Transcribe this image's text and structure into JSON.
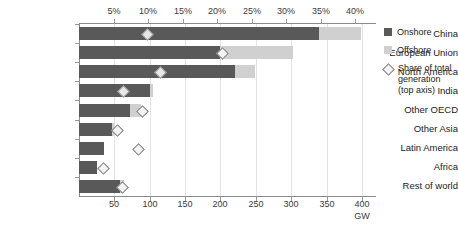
{
  "chart_data": {
    "type": "bar",
    "orientation": "horizontal",
    "title": "",
    "subtitle": "",
    "xlabel": "GW",
    "ylabel": "",
    "categories": [
      "China",
      "European Union",
      "North America",
      "India",
      "Other OECD",
      "Other Asia",
      "Latin America",
      "Africa",
      "Rest of world"
    ],
    "series": [
      {
        "name": "Onshore",
        "unit": "GW",
        "color": "#595959",
        "values": [
          340,
          200,
          220,
          101,
          72,
          47,
          36,
          25,
          58
        ]
      },
      {
        "name": "Offshore",
        "unit": "GW",
        "color": "#d0d0d0",
        "values": [
          59,
          103,
          29,
          3,
          16,
          2,
          0,
          0,
          5
        ]
      },
      {
        "name": "Share of total generation (top axis)",
        "unit": "%",
        "marker": "diamond",
        "axis": "top",
        "values": [
          9.8,
          20.6,
          11.7,
          6.3,
          9.0,
          5.5,
          8.4,
          3.4,
          6.1
        ]
      }
    ],
    "xlim": [
      0,
      420
    ],
    "top_axis": {
      "label": "",
      "lim": [
        0,
        43
      ],
      "ticks": [
        5,
        10,
        15,
        20,
        25,
        30,
        35,
        40
      ],
      "tick_labels": [
        "5%",
        "10%",
        "15%",
        "20%",
        "25%",
        "30%",
        "35%",
        "40%"
      ]
    },
    "bottom_axis": {
      "label": "GW",
      "ticks": [
        50,
        100,
        150,
        200,
        250,
        300,
        350,
        400
      ],
      "tick_labels": [
        "50",
        "100",
        "150",
        "200",
        "250",
        "300",
        "350",
        "400"
      ]
    },
    "grid": true,
    "grid_axis": "x",
    "legend_position": "right",
    "legend": [
      {
        "label": "Onshore",
        "type": "swatch",
        "color": "#595959"
      },
      {
        "label": "Offshore",
        "type": "swatch",
        "color": "#d0d0d0"
      },
      {
        "label": "Share of total generation (top axis)",
        "type": "diamond",
        "color": "#f3f3f3"
      }
    ]
  },
  "legend": {
    "onshore_label": "Onshore",
    "offshore_label": "Offshore",
    "share_label_line1": "Share of total",
    "share_label_line2": "generation",
    "share_label_line3": "(top axis)"
  },
  "colors": {
    "onshore": "#595959",
    "offshore": "#d0d0d0",
    "marker_fill": "#f3f3f3",
    "marker_stroke": "#7d7d7d",
    "axis": "#8a8a8a",
    "grid": "#e2e2e2",
    "text": "#222222"
  }
}
